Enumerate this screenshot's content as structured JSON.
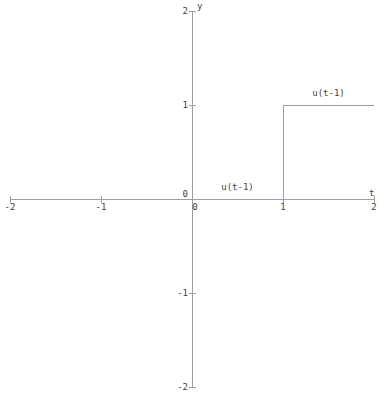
{
  "figure": {
    "background": "#ffffff",
    "line_color": "#9e9e9e",
    "text_color": "#3f3f3f"
  },
  "chart_data": {
    "type": "line",
    "subtype": "step",
    "title": "",
    "xlabel": "t",
    "ylabel": "y",
    "xlim": [
      -2,
      2
    ],
    "ylim": [
      -2,
      2
    ],
    "grid": false,
    "legend_position": "none",
    "xticks": [
      -2,
      -1,
      0,
      1,
      2
    ],
    "yticks": [
      -2,
      -1,
      0,
      1,
      2
    ],
    "xtick_labels": [
      "-2",
      "-1",
      "0",
      "1",
      "2"
    ],
    "ytick_labels": [
      "-2",
      "-1",
      "0",
      "1",
      "2"
    ],
    "series": [
      {
        "name": "u(t-1)",
        "points": [
          [
            -2,
            0
          ],
          [
            1,
            0
          ],
          [
            1,
            1
          ],
          [
            2,
            1
          ]
        ]
      }
    ],
    "annotations": [
      {
        "text": "u(t-1)",
        "x": 0.5,
        "y": 0.1
      },
      {
        "text": "u(t-1)",
        "x": 1.5,
        "y": 1.1
      }
    ]
  }
}
